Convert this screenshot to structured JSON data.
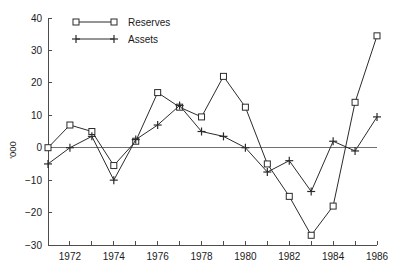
{
  "chart_data": {
    "type": "line",
    "title": "",
    "subtitle": "",
    "xlabel": "",
    "ylabel": "'000",
    "x": [
      1971,
      1972,
      1973,
      1974,
      1975,
      1976,
      1977,
      1978,
      1979,
      1980,
      1981,
      1982,
      1983,
      1984,
      1985,
      1986
    ],
    "xlim": [
      1971,
      1986
    ],
    "ylim": [
      -30,
      40
    ],
    "y_ticks": [
      -30,
      -20,
      -10,
      0,
      10,
      20,
      30,
      40
    ],
    "y_tick_labels": [
      "-30",
      "-20",
      "-10",
      "0",
      "10",
      "20",
      "30",
      "40"
    ],
    "x_ticks": [
      1971,
      1972,
      1973,
      1974,
      1975,
      1976,
      1977,
      1978,
      1979,
      1980,
      1981,
      1982,
      1983,
      1984,
      1985,
      1986
    ],
    "x_tick_labels": [
      "",
      "1972",
      "",
      "1974",
      "",
      "1976",
      "",
      "1978",
      "",
      "1980",
      "",
      "1982",
      "",
      "1984",
      "",
      "1986"
    ],
    "grid": false,
    "zero_line": true,
    "legend_position": "top-left-inside",
    "series": [
      {
        "name": "Reserves",
        "marker": "square",
        "values": [
          0,
          7,
          5,
          -5.5,
          2,
          17,
          12.5,
          9.5,
          22,
          12.5,
          -5,
          -15,
          -27,
          -18,
          14,
          34.5
        ]
      },
      {
        "name": "Assets",
        "marker": "plus",
        "values": [
          -5,
          0,
          3.5,
          -10,
          2.5,
          7,
          13,
          5,
          3.5,
          0,
          -7.5,
          -4,
          -13.5,
          2,
          -1,
          9.5
        ]
      }
    ]
  },
  "legend": {
    "entries": [
      {
        "label": "Reserves",
        "marker": "square"
      },
      {
        "label": "Assets",
        "marker": "plus"
      }
    ]
  },
  "colors": {
    "series_line": "#2b2b2b",
    "axis": "#4d4d4d",
    "zero_line": "#707070",
    "background": "#ffffff",
    "text": "#1a1a1a"
  }
}
